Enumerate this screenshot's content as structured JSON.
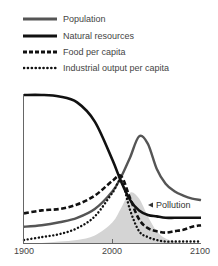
{
  "chart_data": {
    "type": "line",
    "title": "",
    "xlabel": "",
    "ylabel": "",
    "xlim": [
      1900,
      2100
    ],
    "ylim": [
      0,
      100
    ],
    "grid": false,
    "legend_position": "top-left, above plot",
    "x_ticks": [
      1900,
      2000,
      2100
    ],
    "x": [
      1900,
      1920,
      1940,
      1960,
      1980,
      2000,
      2010,
      2020,
      2030,
      2040,
      2050,
      2060,
      2070,
      2080,
      2090,
      2100
    ],
    "series": [
      {
        "name": "Population",
        "style": "solid gray thick",
        "values": [
          11,
          12,
          14,
          17,
          23,
          35,
          45,
          58,
          72,
          67,
          50,
          40,
          35,
          32,
          30,
          29
        ]
      },
      {
        "name": "Natural resources",
        "style": "solid black thick",
        "values": [
          100,
          100,
          99,
          95,
          82,
          56,
          41,
          29,
          22,
          19,
          18,
          17,
          17,
          17,
          17,
          17
        ]
      },
      {
        "name": "Food per capita",
        "style": "dashed black",
        "values": [
          20,
          22,
          23,
          26,
          32,
          42,
          45,
          30,
          16,
          10,
          8,
          7,
          8,
          9,
          11,
          12
        ]
      },
      {
        "name": "Industrial output per capita",
        "style": "dotted black",
        "values": [
          2,
          4,
          6,
          10,
          18,
          34,
          42,
          22,
          8,
          4,
          2,
          1,
          1,
          1,
          1,
          1
        ]
      },
      {
        "name": "Pollution",
        "style": "light gray filled area",
        "values": [
          0,
          0,
          1,
          2,
          5,
          14,
          24,
          34,
          30,
          18,
          8,
          3,
          1,
          0,
          0,
          0
        ]
      }
    ],
    "annotations": [
      {
        "text": "Pollution",
        "x": 2035,
        "y": 32,
        "marker": "triangle"
      }
    ]
  },
  "legend": {
    "items": [
      {
        "label": "Population",
        "color": "#555555",
        "style": "solid"
      },
      {
        "label": "Natural resources",
        "color": "#111111",
        "style": "solid"
      },
      {
        "label": "Food per capita",
        "color": "#111111",
        "style": "dashed"
      },
      {
        "label": "Industrial output per capita",
        "color": "#111111",
        "style": "dotted"
      }
    ]
  },
  "axis": {
    "x_tick_labels": [
      "1900",
      "2000",
      "2100"
    ]
  },
  "annotation": {
    "pollution_label": "Pollution"
  },
  "colors": {
    "population": "#555555",
    "natural_resources": "#111111",
    "food": "#111111",
    "industrial": "#111111",
    "pollution_fill": "#d4d4d4",
    "axis": "#555555"
  }
}
